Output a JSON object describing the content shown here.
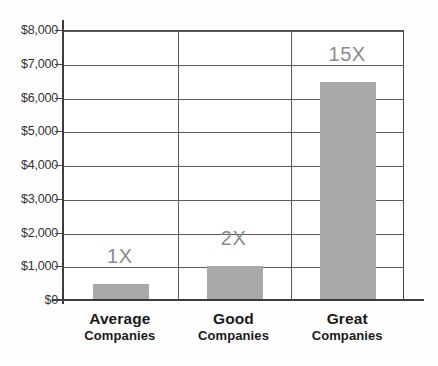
{
  "chart_data": {
    "type": "bar",
    "title": "",
    "subtitle": "",
    "xlabel": "",
    "ylabel": "",
    "categories": [
      "Average Companies",
      "Good Companies",
      "Great Companies"
    ],
    "category_lines": [
      {
        "line1": "Average",
        "line2": "Companies"
      },
      {
        "line1": "Good",
        "line2": "Companies"
      },
      {
        "line1": "Great",
        "line2": "Companies"
      }
    ],
    "values": [
      500,
      1050,
      6500
    ],
    "data_labels": [
      "1X",
      "2X",
      "15X"
    ],
    "ylim": [
      0,
      8000
    ],
    "ytick_values": [
      0,
      1000,
      2000,
      3000,
      4000,
      5000,
      6000,
      7000,
      8000
    ],
    "ytick_labels": [
      "$0",
      "$1,000",
      "$2,000",
      "$3,000",
      "$4,000",
      "$5,000",
      "$6,000",
      "$7,000",
      "$8,000"
    ],
    "grid": true,
    "legend": null,
    "colors": {
      "bar_fill": "#a9a9a9",
      "axis": "#3d3d3d",
      "gridline": "#5a5a5a",
      "tick_label": "#333333",
      "data_label": "#8c8c8c",
      "category_label": "#1a1a1a",
      "background": "#ffffff"
    }
  }
}
